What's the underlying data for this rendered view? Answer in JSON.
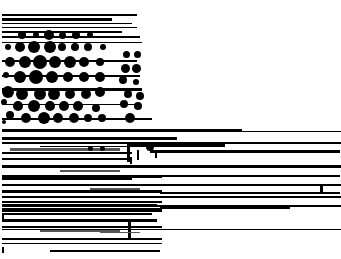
{
  "image": {
    "width": 341,
    "height": 259,
    "background": "#ffffff",
    "foreground": "#000000",
    "description": "Corrupted / glitched render: horizontal black streaks with halftone-like dot field; no legible text"
  },
  "bars": [
    [
      2,
      14,
      135,
      2
    ],
    [
      2,
      18,
      110,
      3
    ],
    [
      2,
      23,
      130,
      1
    ],
    [
      2,
      27,
      135,
      1
    ],
    [
      2,
      31,
      120,
      2
    ],
    [
      2,
      36,
      138,
      2
    ],
    [
      2,
      42,
      140,
      1
    ],
    [
      2,
      60,
      135,
      2
    ],
    [
      2,
      75,
      138,
      2
    ],
    [
      2,
      88,
      140,
      3
    ],
    [
      2,
      104,
      136,
      1
    ],
    [
      2,
      118,
      150,
      2
    ],
    [
      2,
      129,
      240,
      2
    ],
    [
      2,
      131,
      339,
      1
    ],
    [
      2,
      137,
      175,
      3
    ],
    [
      2,
      142,
      339,
      2
    ],
    [
      40,
      146,
      120,
      1
    ],
    [
      130,
      143,
      95,
      4
    ],
    [
      150,
      150,
      190,
      3
    ],
    [
      215,
      151,
      120,
      2
    ],
    [
      2,
      152,
      130,
      2
    ],
    [
      2,
      158,
      130,
      2
    ],
    [
      2,
      165,
      339,
      3
    ],
    [
      130,
      157,
      2,
      7
    ],
    [
      2,
      175,
      160,
      3
    ],
    [
      160,
      175,
      180,
      2
    ],
    [
      2,
      178,
      130,
      2
    ],
    [
      2,
      184,
      339,
      2
    ],
    [
      2,
      190,
      160,
      3
    ],
    [
      160,
      192,
      180,
      2
    ],
    [
      2,
      196,
      339,
      2
    ],
    [
      2,
      201,
      160,
      2
    ],
    [
      2,
      205,
      339,
      2
    ],
    [
      2,
      208,
      160,
      4
    ],
    [
      2,
      213,
      150,
      2
    ],
    [
      2,
      219,
      155,
      3
    ],
    [
      2,
      204,
      155,
      2
    ],
    [
      160,
      206,
      130,
      3
    ],
    [
      2,
      226,
      160,
      2
    ],
    [
      2,
      229,
      339,
      1
    ],
    [
      12,
      226,
      70,
      2
    ],
    [
      2,
      238,
      160,
      2
    ],
    [
      2,
      243,
      160,
      1
    ],
    [
      50,
      250,
      110,
      2
    ],
    [
      2,
      247,
      2,
      6
    ],
    [
      2,
      213,
      2,
      7
    ],
    [
      128,
      220,
      3,
      20
    ],
    [
      127,
      142,
      3,
      20
    ],
    [
      137,
      150,
      2,
      10
    ],
    [
      155,
      150,
      2,
      8
    ],
    [
      320,
      186,
      3,
      6
    ]
  ],
  "grayBars": [
    [
      10,
      148,
      110,
      3
    ],
    [
      60,
      170,
      60,
      2
    ],
    [
      90,
      188,
      50,
      2
    ],
    [
      40,
      230,
      80,
      2
    ],
    [
      100,
      232,
      40,
      1
    ]
  ],
  "dots": [
    [
      22,
      35,
      8
    ],
    [
      36,
      35,
      6
    ],
    [
      49,
      35,
      10
    ],
    [
      62,
      35,
      7
    ],
    [
      76,
      35,
      8
    ],
    [
      90,
      35,
      6
    ],
    [
      8,
      47,
      6
    ],
    [
      20,
      47,
      10
    ],
    [
      34,
      47,
      12
    ],
    [
      50,
      47,
      12
    ],
    [
      62,
      47,
      8
    ],
    [
      75,
      47,
      8
    ],
    [
      88,
      47,
      8
    ],
    [
      103,
      47,
      6
    ],
    [
      126,
      54,
      7
    ],
    [
      137,
      54,
      7
    ],
    [
      10,
      62,
      10
    ],
    [
      25,
      62,
      12
    ],
    [
      40,
      62,
      14
    ],
    [
      55,
      62,
      12
    ],
    [
      70,
      62,
      12
    ],
    [
      84,
      62,
      10
    ],
    [
      100,
      62,
      8
    ],
    [
      125,
      68,
      9
    ],
    [
      136,
      68,
      9
    ],
    [
      6,
      75,
      6
    ],
    [
      20,
      77,
      12
    ],
    [
      36,
      77,
      14
    ],
    [
      52,
      77,
      12
    ],
    [
      68,
      77,
      10
    ],
    [
      84,
      77,
      10
    ],
    [
      100,
      77,
      10
    ],
    [
      123,
      80,
      8
    ],
    [
      136,
      82,
      6
    ],
    [
      8,
      92,
      12
    ],
    [
      22,
      94,
      12
    ],
    [
      40,
      94,
      12
    ],
    [
      54,
      94,
      12
    ],
    [
      70,
      94,
      10
    ],
    [
      86,
      94,
      10
    ],
    [
      100,
      92,
      10
    ],
    [
      128,
      94,
      8
    ],
    [
      140,
      96,
      8
    ],
    [
      4,
      102,
      6
    ],
    [
      18,
      106,
      10
    ],
    [
      34,
      106,
      12
    ],
    [
      50,
      106,
      10
    ],
    [
      64,
      106,
      10
    ],
    [
      78,
      106,
      10
    ],
    [
      96,
      108,
      8
    ],
    [
      124,
      104,
      8
    ],
    [
      138,
      106,
      8
    ],
    [
      10,
      115,
      8
    ],
    [
      26,
      118,
      10
    ],
    [
      44,
      118,
      12
    ],
    [
      58,
      118,
      10
    ],
    [
      74,
      118,
      10
    ],
    [
      88,
      118,
      8
    ],
    [
      102,
      118,
      8
    ],
    [
      130,
      118,
      10
    ],
    [
      4,
      122,
      4
    ],
    [
      90,
      148,
      5
    ],
    [
      102,
      148,
      5
    ],
    [
      150,
      147,
      8
    ]
  ]
}
